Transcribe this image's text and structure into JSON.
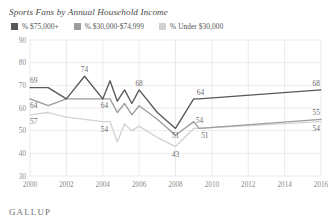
{
  "chart_data": {
    "type": "line",
    "title": "Sports Fans by Annual Household Income",
    "xlabel": "",
    "ylabel": "",
    "xlim": [
      2000,
      2016
    ],
    "ylim": [
      30,
      90
    ],
    "yticks": [
      30,
      40,
      50,
      60,
      70,
      80,
      90
    ],
    "xticks": [
      2000,
      2002,
      2004,
      2006,
      2008,
      2010,
      2012,
      2014,
      2016
    ],
    "grid": true,
    "legend_position": "top-left",
    "colors": {
      "high_income": "#58585a",
      "mid_income": "#9c9c9e",
      "low_income": "#d2d2d3"
    },
    "series": [
      {
        "name": "% $75,000+",
        "color": "#58585a",
        "x": [
          2000,
          2001,
          2002,
          2003,
          2004,
          2004.4,
          2004.8,
          2005.2,
          2005.6,
          2006,
          2007,
          2008,
          2009,
          2009.3,
          2016
        ],
        "values": [
          69,
          69,
          64,
          74,
          64,
          72,
          63,
          68,
          62,
          68,
          58,
          51,
          64,
          64,
          68
        ]
      },
      {
        "name": "% $30,000-$74,999",
        "color": "#9c9c9e",
        "x": [
          2000,
          2001,
          2002,
          2003,
          2004,
          2004.4,
          2004.8,
          2005.2,
          2005.6,
          2006,
          2007,
          2008,
          2009,
          2009.3,
          2016
        ],
        "values": [
          64,
          61,
          64,
          64,
          64,
          64,
          58,
          62,
          57,
          61,
          55,
          48,
          54,
          51,
          55
        ]
      },
      {
        "name": "% Under $30,000",
        "color": "#d2d2d3",
        "x": [
          2000,
          2001,
          2002,
          2003,
          2004,
          2004.4,
          2004.8,
          2005.2,
          2005.6,
          2006,
          2007,
          2008,
          2009,
          2009.3,
          2016
        ],
        "values": [
          57,
          58,
          56,
          55,
          54,
          54,
          45,
          53,
          50,
          52,
          47,
          43,
          51,
          51,
          54
        ]
      }
    ],
    "point_labels": [
      {
        "text": "69",
        "x": 2000,
        "y": 69,
        "dx": 0,
        "dy": -5,
        "anchor": "start"
      },
      {
        "text": "64",
        "x": 2000,
        "y": 64,
        "dx": 0,
        "dy": 9,
        "anchor": "start"
      },
      {
        "text": "57",
        "x": 2000,
        "y": 57,
        "dx": 0,
        "dy": 9,
        "anchor": "start"
      },
      {
        "text": "74",
        "x": 2003,
        "y": 74,
        "dx": 0,
        "dy": -4,
        "anchor": "middle"
      },
      {
        "text": "64",
        "x": 2004.1,
        "y": 64,
        "dx": 0,
        "dy": 9,
        "anchor": "middle"
      },
      {
        "text": "54",
        "x": 2004.1,
        "y": 54,
        "dx": 0,
        "dy": 10,
        "anchor": "middle"
      },
      {
        "text": "68",
        "x": 2006,
        "y": 68,
        "dx": 0,
        "dy": -4,
        "anchor": "middle"
      },
      {
        "text": "51",
        "x": 2008,
        "y": 51,
        "dx": 0,
        "dy": 10,
        "anchor": "middle"
      },
      {
        "text": "43",
        "x": 2008,
        "y": 43,
        "dx": 0,
        "dy": 10,
        "anchor": "middle"
      },
      {
        "text": "64",
        "x": 2009,
        "y": 64,
        "dx": 3,
        "dy": -4,
        "anchor": "start"
      },
      {
        "text": "54",
        "x": 2009,
        "y": 54,
        "dx": 2,
        "dy": 1,
        "anchor": "start"
      },
      {
        "text": "51",
        "x": 2009.3,
        "y": 51,
        "dx": 2,
        "dy": 10,
        "anchor": "start"
      },
      {
        "text": "68",
        "x": 2016,
        "y": 68,
        "dx": -1,
        "dy": -4,
        "anchor": "end"
      },
      {
        "text": "55",
        "x": 2016,
        "y": 55,
        "dx": -1,
        "dy": -4,
        "anchor": "end"
      },
      {
        "text": "54",
        "x": 2016,
        "y": 54,
        "dx": -1,
        "dy": 9,
        "anchor": "end"
      }
    ]
  },
  "legend": {
    "items": [
      {
        "label": "% $75,000+",
        "color": "#58585a"
      },
      {
        "label": "% $30,000-$74,999",
        "color": "#9c9c9e"
      },
      {
        "label": "% Under $30,000",
        "color": "#d2d2d3"
      }
    ]
  },
  "branding": {
    "logo_text": "GALLUP"
  }
}
